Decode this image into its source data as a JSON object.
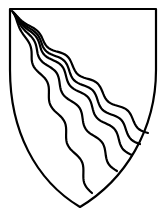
{
  "figure": {
    "type": "coat-of-arms",
    "field_color": "#ffffff",
    "line_color": "#000000",
    "charge": {
      "name": "bendlets wavy",
      "count": 5
    }
  }
}
